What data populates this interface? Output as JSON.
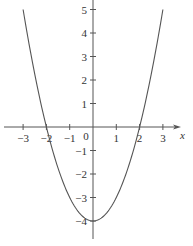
{
  "chart_data": {
    "type": "line",
    "title": "",
    "function": "y = x^2 - 4",
    "xlabel": "x",
    "ylabel": "",
    "xlim": [
      -3.3,
      3.4
    ],
    "ylim": [
      -4.7,
      5.4
    ],
    "grid": false,
    "x_ticks": [
      -3,
      -2,
      -1,
      1,
      2,
      3
    ],
    "x_tick_labels": [
      "−3",
      "−2",
      "−1",
      "1",
      "2",
      "3"
    ],
    "y_ticks": [
      5,
      4,
      3,
      2,
      1,
      -1,
      -2,
      -3,
      -4
    ],
    "y_tick_labels": [
      "5",
      "4",
      "3",
      "2",
      "1",
      "−1",
      "−2",
      "−3",
      "−4"
    ],
    "origin_label": "0",
    "series": [
      {
        "name": "parabola",
        "x": [
          -3,
          -2.5,
          -2,
          -1.5,
          -1,
          -0.5,
          0,
          0.5,
          1,
          1.5,
          2,
          2.5,
          3
        ],
        "y": [
          5,
          2.25,
          0,
          -1.75,
          -3,
          -3.75,
          -4,
          -3.75,
          -3,
          -1.75,
          0,
          2.25,
          5
        ]
      }
    ],
    "color": "#555555"
  }
}
